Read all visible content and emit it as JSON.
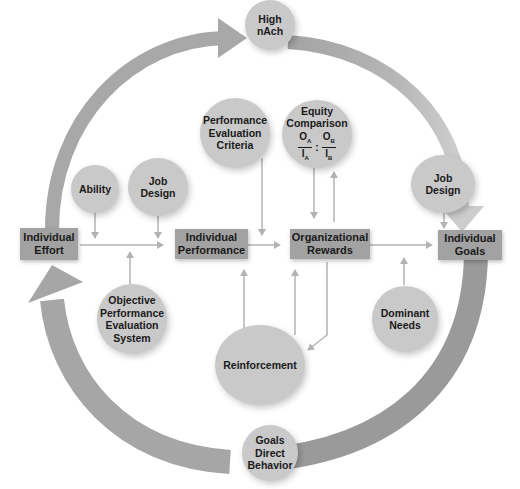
{
  "colors": {
    "big_arrow": "#9e9e9e",
    "big_arrow_light": "#c4c4c4",
    "box_fill": "#a2a2a2",
    "circle_fill": "#c9c9c9",
    "connector": "#b3b3b3"
  },
  "boxes": {
    "effort": {
      "line1": "Individual",
      "line2": "Effort"
    },
    "performance": {
      "line1": "Individual",
      "line2": "Performance"
    },
    "rewards": {
      "line1": "Organizational",
      "line2": "Rewards"
    },
    "goals": {
      "line1": "Individual",
      "line2": "Goals"
    }
  },
  "circles": {
    "high_nach": {
      "line1": "High",
      "line2": "nAch"
    },
    "perf_criteria": {
      "line1": "Performance",
      "line2": "Evaluation",
      "line3": "Criteria"
    },
    "equity": {
      "line1": "Equity",
      "line2": "Comparison",
      "o_a": "O",
      "o_a_sub": "A",
      "i_a": "I",
      "i_a_sub": "A",
      "sep": ":",
      "o_b": "O",
      "o_b_sub": "B",
      "i_b": "I",
      "i_b_sub": "B"
    },
    "ability": {
      "line1": "Ability"
    },
    "job_design_left": {
      "line1": "Job",
      "line2": "Design"
    },
    "job_design_right": {
      "line1": "Job",
      "line2": "Design"
    },
    "objective_system": {
      "line1": "Objective",
      "line2": "Performance",
      "line3": "Evaluation",
      "line4": "System"
    },
    "reinforcement": {
      "line1": "Reinforcement"
    },
    "dominant_needs": {
      "line1": "Dominant",
      "line2": "Needs"
    },
    "goals_direct": {
      "line1": "Goals",
      "line2": "Direct",
      "line3": "Behavior"
    }
  }
}
